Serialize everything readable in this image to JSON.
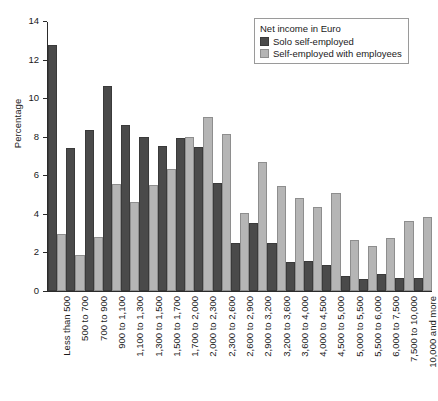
{
  "chart_data": {
    "type": "bar",
    "title": "",
    "xlabel": "",
    "ylabel": "Percentage",
    "ylim": [
      0,
      14
    ],
    "yticks": [
      0,
      2,
      4,
      6,
      8,
      10,
      12,
      14
    ],
    "grid": false,
    "legend_position": "top-right",
    "legend_title": "Net income in Euro",
    "categories": [
      "Less than 500",
      "500 to 700",
      "700 to 900",
      "900 to 1,100",
      "1,100 to 1,300",
      "1,300 to 1,500",
      "1,500 to 1,700",
      "1,700 to 2,000",
      "2,000 to 2,300",
      "2,300 to 2,600",
      "2,600 to 2,900",
      "2,900 to 3,200",
      "3,200 to 3,600",
      "3,600 to 4,000",
      "4,000 to 4,500",
      "4,500 to 5,000",
      "5,000 to 5,500",
      "5,500 to 6,000",
      "6,000 to 7,500",
      "7,500 to 10,000",
      "10,000 and more"
    ],
    "series": [
      {
        "name": "Solo self-employed",
        "color": "#4a4a4a",
        "values": [
          12.75,
          7.4,
          8.35,
          10.65,
          8.6,
          8.0,
          7.5,
          7.95,
          7.45,
          5.6,
          2.5,
          3.55,
          2.5,
          1.5,
          1.55,
          1.35,
          0.8,
          0.6,
          0.9,
          0.65,
          0.65
        ]
      },
      {
        "name": "Self-employed with employees",
        "color": "#b5b5b5",
        "values": [
          2.95,
          1.85,
          2.8,
          5.55,
          4.6,
          5.5,
          6.35,
          8.0,
          9.0,
          8.15,
          4.05,
          6.7,
          5.45,
          4.8,
          4.35,
          5.1,
          2.65,
          2.35,
          2.75,
          3.65,
          3.85
        ]
      }
    ]
  }
}
